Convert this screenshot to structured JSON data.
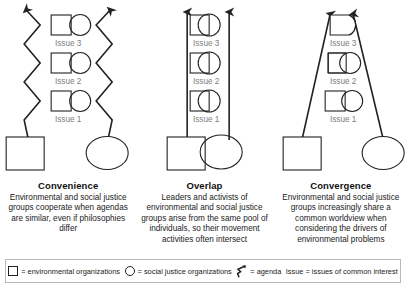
{
  "figure": {
    "panels": [
      {
        "id": "convenience",
        "title": "Convenience",
        "description": "Environmental and social justice groups cooperate when agendas are similar, even if philosophies differ",
        "relation": "touching",
        "issues": [
          {
            "label": "Issue 3"
          },
          {
            "label": "Issue 2"
          },
          {
            "label": "Issue 1"
          }
        ],
        "base_shapes": {
          "environmental": "square",
          "social_justice": "ellipse"
        },
        "agenda_paths": "zigzag"
      },
      {
        "id": "overlap",
        "title": "Overlap",
        "description": "Leaders and activists of environmental and social justice groups arise from the same pool of individuals, so their movement activities often intersect",
        "relation": "overlapping",
        "issues": [
          {
            "label": "Issue 3"
          },
          {
            "label": "Issue 2"
          },
          {
            "label": "Issue 1"
          }
        ],
        "base_shapes": {
          "environmental": "square",
          "social_justice": "ellipse"
        },
        "agenda_paths": "straight-vertical"
      },
      {
        "id": "convergence",
        "title": "Convergence",
        "description": "Environmental and social justice groups increasingly share a common worldview when considering the drivers of environmental problems",
        "relation": "merging",
        "issues": [
          {
            "label": "Issue 3"
          },
          {
            "label": "Issue 2"
          },
          {
            "label": "Issue 1"
          }
        ],
        "base_shapes": {
          "environmental": "square",
          "social_justice": "ellipse"
        },
        "agenda_paths": "converging"
      }
    ]
  },
  "legend": {
    "items": [
      {
        "icon": "square-icon",
        "text": "= environmental organizations"
      },
      {
        "icon": "circle-icon",
        "text": "= social justice organizations"
      },
      {
        "icon": "agenda-arrow-icon",
        "text": "= agenda"
      },
      {
        "icon": "none",
        "text": "Issue = issues of common interest"
      }
    ]
  },
  "colors": {
    "stroke": "#222222",
    "issue_label": "#7d7d7d",
    "legend_border": "#b9b9b9",
    "text": "#1a1a1a"
  }
}
